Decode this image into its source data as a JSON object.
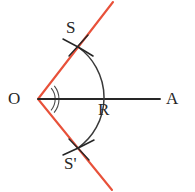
{
  "figure": {
    "width": 195,
    "height": 192,
    "background_color": "#ffffff"
  },
  "colors": {
    "ray_red": "#e8513a",
    "ink_black": "#262626",
    "arc_gray": "#3a3a3a",
    "background": "#ffffff"
  },
  "labels": {
    "vertex": "O",
    "ray_end": "A",
    "arc_on_bisector": "R",
    "upper_intersection": "S",
    "lower_intersection": "S'"
  },
  "geometry": {
    "vertex": {
      "x": 38,
      "y": 99
    },
    "bisector_ray": {
      "x1": 38,
      "y1": 99,
      "x2": 160,
      "y2": 99
    },
    "upper_arm": {
      "x1": 38,
      "y1": 99,
      "x2": 113,
      "y2": 2
    },
    "lower_arm": {
      "x1": 38,
      "y1": 99,
      "x2": 112,
      "y2": 190
    },
    "main_arc": {
      "radius": 62,
      "start": {
        "x": 78,
        "y": 47
      },
      "through": {
        "x": 100,
        "y": 99
      },
      "end": {
        "x": 78,
        "y": 148
      }
    },
    "cross_upper": {
      "x": 78,
      "y": 47
    },
    "cross_lower": {
      "x": 78,
      "y": 148
    },
    "angle_marks": [
      {
        "radius": 17
      },
      {
        "radius": 21
      }
    ]
  }
}
